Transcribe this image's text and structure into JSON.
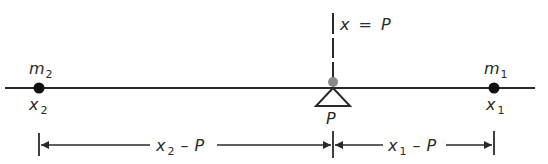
{
  "diagram": {
    "type": "lever-balance",
    "colors": {
      "line": "#2a2a2a",
      "mass_dot": "#111111",
      "pivot_dot": "#8a8a8a",
      "background": "#ffffff"
    },
    "axis_line": {
      "x_start": 5,
      "x_end": 535,
      "y": 88
    },
    "pivot": {
      "label": "P",
      "equation_label": {
        "var": "x",
        "eq": "=",
        "val": "P"
      },
      "x": 333
    },
    "masses": [
      {
        "mass_label": "m",
        "mass_sub": "2",
        "pos_label": "x",
        "pos_sub": "2",
        "x": 39
      },
      {
        "mass_label": "m",
        "mass_sub": "1",
        "pos_label": "x",
        "pos_sub": "1",
        "x": 494
      }
    ],
    "dimensions": [
      {
        "var": "x",
        "sub": "2",
        "minus": "–",
        "val": "P",
        "from_x": 39,
        "to_x": 333
      },
      {
        "var": "x",
        "sub": "1",
        "minus": "–",
        "val": "P",
        "from_x": 333,
        "to_x": 494
      }
    ]
  }
}
